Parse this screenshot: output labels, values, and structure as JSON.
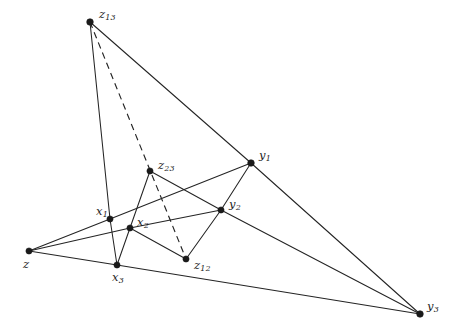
{
  "figure": {
    "width": 454,
    "height": 333,
    "background_color": "#ffffff",
    "line_color": "#242424",
    "vertex_color": "#1a1a1a"
  },
  "vertices": [
    {
      "id": "z",
      "base": "z",
      "sub": "",
      "x": 29,
      "y": 251,
      "label_dx": -6,
      "label_dy": 8,
      "dot_r": 3.1
    },
    {
      "id": "z13",
      "base": "z",
      "sub": "13",
      "x": 90,
      "y": 22,
      "label_dx": 9,
      "label_dy": -13,
      "dot_r": 3.3
    },
    {
      "id": "z23",
      "base": "z",
      "sub": "23",
      "x": 150,
      "y": 171,
      "label_dx": 8,
      "label_dy": -11,
      "dot_r": 3.1
    },
    {
      "id": "z12",
      "base": "z",
      "sub": "12",
      "x": 186,
      "y": 259,
      "label_dx": 8,
      "label_dy": 1,
      "dot_r": 3.1
    },
    {
      "id": "x1",
      "base": "x",
      "sub": "1",
      "x": 110,
      "y": 219,
      "label_dx": -14,
      "label_dy": -13,
      "dot_r": 3.1
    },
    {
      "id": "x2",
      "base": "x",
      "sub": "2",
      "x": 130,
      "y": 228,
      "label_dx": 7,
      "label_dy": -11,
      "dot_r": 3.1
    },
    {
      "id": "x3",
      "base": "x",
      "sub": "3",
      "x": 117,
      "y": 265,
      "label_dx": -5,
      "label_dy": 7,
      "dot_r": 3.1
    },
    {
      "id": "y1",
      "base": "y",
      "sub": "1",
      "x": 251,
      "y": 163,
      "label_dx": 8,
      "label_dy": -13,
      "dot_r": 3.3
    },
    {
      "id": "y2",
      "base": "y",
      "sub": "2",
      "x": 221,
      "y": 210,
      "label_dx": 8,
      "label_dy": -11,
      "dot_r": 3.1
    },
    {
      "id": "y3",
      "base": "y",
      "sub": "3",
      "x": 420,
      "y": 314,
      "label_dx": 7,
      "label_dy": -13,
      "dot_r": 3.3
    }
  ],
  "edges_solid": [
    {
      "from": "z13",
      "to": "x1"
    },
    {
      "from": "x1",
      "to": "x3"
    },
    {
      "from": "z13",
      "to": "y1"
    },
    {
      "from": "y1",
      "to": "y3"
    },
    {
      "from": "z",
      "to": "x1"
    },
    {
      "from": "x1",
      "to": "y1"
    },
    {
      "from": "z",
      "to": "x2"
    },
    {
      "from": "x2",
      "to": "y2"
    },
    {
      "from": "z",
      "to": "x3"
    },
    {
      "from": "x3",
      "to": "y3"
    },
    {
      "from": "z23",
      "to": "x3"
    },
    {
      "from": "z23",
      "to": "y2"
    },
    {
      "from": "x2",
      "to": "z12"
    },
    {
      "from": "z12",
      "to": "y2"
    },
    {
      "from": "y1",
      "to": "y2"
    },
    {
      "from": "y2",
      "to": "y3"
    }
  ],
  "edges_dashed": [
    {
      "from": "z13",
      "to": "z12"
    }
  ]
}
